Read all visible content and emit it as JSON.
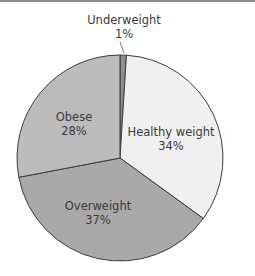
{
  "chart_data": {
    "type": "pie",
    "title": "",
    "start_angle_deg": 0,
    "direction": "clockwise",
    "slices": [
      {
        "label": "Underweight",
        "value": 1,
        "display": "1%",
        "color": "#8f8f8f"
      },
      {
        "label": "Healthy weight",
        "value": 34,
        "display": "34%",
        "color": "#f0f0f0"
      },
      {
        "label": "Overweight",
        "value": 37,
        "display": "37%",
        "color": "#a9a9a9"
      },
      {
        "label": "Obese",
        "value": 28,
        "display": "28%",
        "color": "#bcbcbc"
      }
    ],
    "categories": [
      "Underweight",
      "Healthy weight",
      "Overweight",
      "Obese"
    ],
    "values": [
      1,
      34,
      37,
      28
    ],
    "legend": "none (labels on slices)"
  },
  "labels": {
    "underweight": {
      "name": "Underweight",
      "pct": "1%"
    },
    "healthy": {
      "name": "Healthy weight",
      "pct": "34%"
    },
    "overweight": {
      "name": "Overweight",
      "pct": "37%"
    },
    "obese": {
      "name": "Obese",
      "pct": "28%"
    }
  }
}
